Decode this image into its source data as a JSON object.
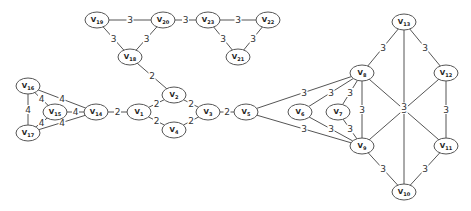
{
  "diagram": {
    "type": "weighted-undirected-graph",
    "nodes": [
      {
        "id": "V19",
        "x": 97,
        "y": 20
      },
      {
        "id": "V20",
        "x": 163,
        "y": 20
      },
      {
        "id": "V23",
        "x": 208,
        "y": 20
      },
      {
        "id": "V22",
        "x": 268,
        "y": 20
      },
      {
        "id": "V21",
        "x": 238,
        "y": 57
      },
      {
        "id": "V18",
        "x": 130,
        "y": 57
      },
      {
        "id": "V16",
        "x": 28,
        "y": 86
      },
      {
        "id": "V15",
        "x": 55,
        "y": 112
      },
      {
        "id": "V14",
        "x": 96,
        "y": 112
      },
      {
        "id": "V17",
        "x": 28,
        "y": 133
      },
      {
        "id": "V1",
        "x": 139,
        "y": 112
      },
      {
        "id": "V2",
        "x": 174,
        "y": 95
      },
      {
        "id": "V4",
        "x": 174,
        "y": 130
      },
      {
        "id": "V3",
        "x": 208,
        "y": 112
      },
      {
        "id": "V5",
        "x": 246,
        "y": 112
      },
      {
        "id": "V6",
        "x": 300,
        "y": 112
      },
      {
        "id": "V7",
        "x": 338,
        "y": 112
      },
      {
        "id": "V8",
        "x": 362,
        "y": 73
      },
      {
        "id": "V9",
        "x": 362,
        "y": 146
      },
      {
        "id": "V13",
        "x": 404,
        "y": 22
      },
      {
        "id": "V12",
        "x": 446,
        "y": 73
      },
      {
        "id": "V11",
        "x": 446,
        "y": 146
      },
      {
        "id": "V10",
        "x": 404,
        "y": 192
      }
    ],
    "edges": [
      {
        "from": "V19",
        "to": "V20",
        "weight": "3"
      },
      {
        "from": "V19",
        "to": "V18",
        "weight": "3"
      },
      {
        "from": "V20",
        "to": "V18",
        "weight": "3"
      },
      {
        "from": "V20",
        "to": "V23",
        "weight": "3"
      },
      {
        "from": "V23",
        "to": "V22",
        "weight": "3"
      },
      {
        "from": "V23",
        "to": "V21",
        "weight": "3"
      },
      {
        "from": "V22",
        "to": "V21",
        "weight": "3"
      },
      {
        "from": "V18",
        "to": "V2",
        "weight": "2"
      },
      {
        "from": "V16",
        "to": "V17",
        "weight": "4"
      },
      {
        "from": "V16",
        "to": "V15",
        "weight": "4"
      },
      {
        "from": "V16",
        "to": "V14",
        "weight": "4"
      },
      {
        "from": "V15",
        "to": "V14",
        "weight": "4"
      },
      {
        "from": "V15",
        "to": "V17",
        "weight": "4"
      },
      {
        "from": "V17",
        "to": "V14",
        "weight": "4"
      },
      {
        "from": "V14",
        "to": "V1",
        "weight": "2"
      },
      {
        "from": "V1",
        "to": "V2",
        "weight": "2"
      },
      {
        "from": "V1",
        "to": "V4",
        "weight": "2"
      },
      {
        "from": "V2",
        "to": "V3",
        "weight": "2"
      },
      {
        "from": "V4",
        "to": "V3",
        "weight": "2"
      },
      {
        "from": "V3",
        "to": "V5",
        "weight": "2"
      },
      {
        "from": "V5",
        "to": "V8",
        "weight": "3"
      },
      {
        "from": "V6",
        "to": "V8",
        "weight": "3"
      },
      {
        "from": "V7",
        "to": "V8",
        "weight": "3"
      },
      {
        "from": "V5",
        "to": "V9",
        "weight": "3"
      },
      {
        "from": "V6",
        "to": "V9",
        "weight": "3"
      },
      {
        "from": "V7",
        "to": "V9",
        "weight": "3"
      },
      {
        "from": "V8",
        "to": "V9",
        "weight": "3"
      },
      {
        "from": "V8",
        "to": "V13",
        "weight": "3"
      },
      {
        "from": "V13",
        "to": "V12",
        "weight": "3"
      },
      {
        "from": "V8",
        "to": "V11",
        "weight": "3"
      },
      {
        "from": "V12",
        "to": "V9",
        "weight": "3"
      },
      {
        "from": "V13",
        "to": "V10",
        "weight": "3"
      },
      {
        "from": "V12",
        "to": "V11",
        "weight": "3"
      },
      {
        "from": "V9",
        "to": "V10",
        "weight": "3"
      },
      {
        "from": "V11",
        "to": "V10",
        "weight": "3"
      }
    ]
  }
}
